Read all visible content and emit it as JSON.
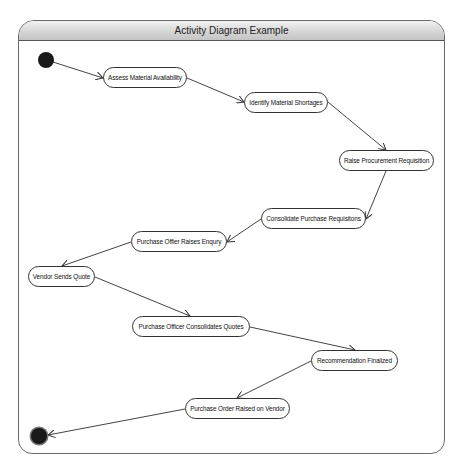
{
  "diagram": {
    "title": "Activity Diagram Example",
    "type": "UML activity diagram",
    "start_node": "initial",
    "end_node": "final",
    "activities": [
      {
        "id": "a1",
        "label": "Assess Material Availability"
      },
      {
        "id": "a2",
        "label": "Identify Material Shortages"
      },
      {
        "id": "a3",
        "label": "Raise Procurement Requisition"
      },
      {
        "id": "a4",
        "label": "Consolidate Purchase Requisitons"
      },
      {
        "id": "a5",
        "label": "Purchase Offier Raises Enqury"
      },
      {
        "id": "a6",
        "label": "Vendor Sends Quote"
      },
      {
        "id": "a7",
        "label": "Purchase Officer Consolidates Quotes"
      },
      {
        "id": "a8",
        "label": "Recommendation Finalized"
      },
      {
        "id": "a9",
        "label": "Purchase Order Raised on Vendor"
      }
    ],
    "flows": [
      [
        "initial",
        "a1"
      ],
      [
        "a1",
        "a2"
      ],
      [
        "a2",
        "a3"
      ],
      [
        "a3",
        "a4"
      ],
      [
        "a4",
        "a5"
      ],
      [
        "a5",
        "a6"
      ],
      [
        "a6",
        "a7"
      ],
      [
        "a7",
        "a8"
      ],
      [
        "a8",
        "a9"
      ],
      [
        "a9",
        "final"
      ]
    ]
  }
}
